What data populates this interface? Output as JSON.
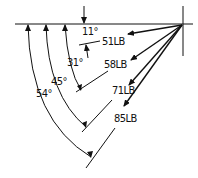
{
  "diagram": {
    "type": "force-angle-diagram",
    "forces": [
      {
        "id": "f1",
        "label": "51LB",
        "angle_label": "11°",
        "angle_deg": 11
      },
      {
        "id": "f2",
        "label": "58LB",
        "angle_label": "31°",
        "angle_deg": 31
      },
      {
        "id": "f3",
        "label": "71LB",
        "angle_label": "45°",
        "angle_deg": 45
      },
      {
        "id": "f4",
        "label": "85LB",
        "angle_label": "54°",
        "angle_deg": 54
      }
    ],
    "colors": {
      "line": "#111111",
      "background": "#ffffff"
    }
  }
}
